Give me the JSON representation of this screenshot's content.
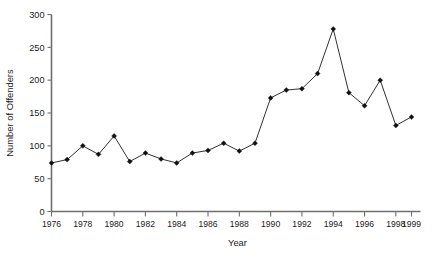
{
  "chart_data": {
    "type": "line",
    "title": "",
    "xlabel": "Year",
    "ylabel": "Number of Offenders",
    "xlim": [
      1976,
      1999
    ],
    "ylim": [
      0,
      300
    ],
    "grid": false,
    "legend": "none",
    "marker": "filled-diamond",
    "line_color": "#1a1a1a",
    "marker_color": "#111111",
    "axis_color": "#6f6f6f",
    "x": [
      1976,
      1977,
      1978,
      1979,
      1980,
      1981,
      1982,
      1983,
      1984,
      1985,
      1986,
      1987,
      1988,
      1989,
      1990,
      1991,
      1992,
      1993,
      1994,
      1995,
      1996,
      1997,
      1998,
      1999
    ],
    "values": [
      74,
      79,
      100,
      87,
      115,
      76,
      89,
      80,
      74,
      89,
      93,
      104,
      92,
      104,
      173,
      185,
      187,
      210,
      278,
      181,
      161,
      200,
      131,
      144
    ],
    "ytick_values": [
      0,
      50,
      100,
      150,
      200,
      250,
      300
    ],
    "ytick_labels": [
      "0",
      "50",
      "100",
      "150",
      "200",
      "250",
      "300"
    ],
    "xtick_values": [
      1976,
      1978,
      1980,
      1982,
      1984,
      1986,
      1988,
      1990,
      1992,
      1994,
      1996,
      1998,
      1999
    ],
    "xtick_labels": [
      "1976",
      "1978",
      "1980",
      "1982",
      "1984",
      "1986",
      "1988",
      "1990",
      "1992",
      "1994",
      "1996",
      "1998",
      "1999"
    ]
  }
}
